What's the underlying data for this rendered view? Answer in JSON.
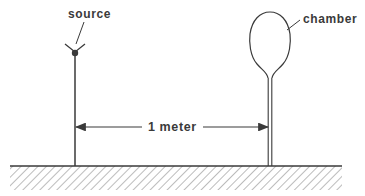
{
  "diagram": {
    "labels": {
      "source": "source",
      "chamber": "chamber",
      "distance": "1 meter"
    },
    "colors": {
      "ink": "#3a3a3a",
      "background": "#ffffff",
      "hatch": "#7a7a7a"
    }
  }
}
